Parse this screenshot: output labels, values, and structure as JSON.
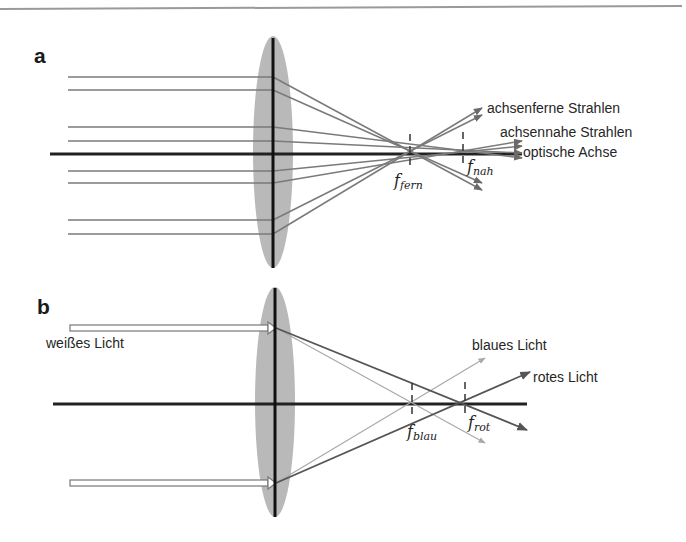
{
  "colors": {
    "lens": "#b9b9b9",
    "axis": "#222222",
    "ray": "#7a7a7a",
    "red_light_ray": "#555555",
    "blue_light_ray": "#a9a9a9",
    "frame_line": "#9a9a9a"
  },
  "panel_a": {
    "letter": "a",
    "labels": {
      "far_rays": "achsenferne Strahlen",
      "near_rays": "achsennahe Strahlen",
      "optical_axis": "optische Achse"
    },
    "focal_points": [
      {
        "symbol": "f",
        "sub": "fern"
      },
      {
        "symbol": "f",
        "sub": "nah"
      }
    ]
  },
  "panel_b": {
    "letter": "b",
    "labels": {
      "white_light": "weißes Licht",
      "blue_light": "blaues Licht",
      "red_light": "rotes Licht"
    },
    "focal_points": [
      {
        "symbol": "f",
        "sub": "blau"
      },
      {
        "symbol": "f",
        "sub": "rot"
      }
    ]
  }
}
